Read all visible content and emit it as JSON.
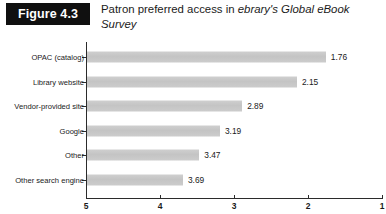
{
  "figure": {
    "badge_label": "Figure 4.3",
    "title_part1": "Patron preferred access in ",
    "title_emphasis": "ebrary's Global eBook Survey"
  },
  "chart_data": {
    "type": "bar",
    "orientation": "horizontal",
    "title": "Patron preferred access in ebrary's Global eBook Survey",
    "categories": [
      "OPAC (catalog)",
      "Library website",
      "Vendor-provided site",
      "Google",
      "Other",
      "Other search engine"
    ],
    "values": [
      1.76,
      2.15,
      2.89,
      3.19,
      3.47,
      3.69
    ],
    "value_labels": [
      "1.76",
      "2.15",
      "2.89",
      "3.19",
      "3.47",
      "3.69"
    ],
    "xlabel": "",
    "ylabel": "",
    "xlim": [
      5,
      1
    ],
    "x_reversed": true,
    "xticks": [
      5,
      4,
      3,
      2,
      1
    ],
    "xtick_labels": [
      "5",
      "4",
      "3",
      "2",
      "1"
    ],
    "grid": false,
    "legend": false,
    "bar_color": "#c9c9c9",
    "axis_color": "#2b2b2b"
  }
}
